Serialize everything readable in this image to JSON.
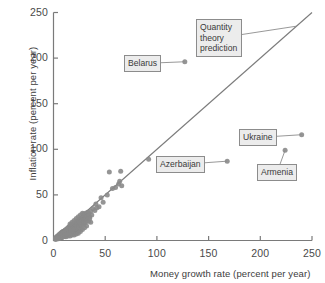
{
  "chart_data": {
    "type": "scatter",
    "title": "",
    "xlabel": "Money growth rate (percent per year)",
    "ylabel": "Inflation rate (percent per year)",
    "xlim": [
      0,
      250
    ],
    "ylim": [
      0,
      250
    ],
    "xticks": [
      0,
      50,
      100,
      150,
      200,
      250
    ],
    "yticks": [
      0,
      50,
      100,
      150,
      200,
      250
    ],
    "xtick_labels": [
      "0",
      "50",
      "100",
      "150",
      "200",
      "250"
    ],
    "ytick_labels": [
      "0",
      "50",
      "100",
      "150",
      "200",
      "250"
    ],
    "grid": false,
    "legend": "none",
    "point_color": "#8a8a8a",
    "line_color": "#7b7b7b",
    "frame_color": "#7a7a7a",
    "reference_line": {
      "name": "Quantity theory prediction",
      "slope": 1,
      "intercept": 0,
      "x": [
        0,
        250
      ],
      "y": [
        0,
        250
      ]
    },
    "series": [
      {
        "name": "Countries",
        "points": [
          [
            127,
            196
          ],
          [
            240,
            116
          ],
          [
            224,
            99
          ],
          [
            168,
            87
          ],
          [
            92,
            89
          ],
          [
            65,
            76
          ],
          [
            54,
            75
          ],
          [
            64,
            65
          ],
          [
            63,
            62
          ],
          [
            66,
            60
          ],
          [
            46,
            47
          ],
          [
            41,
            40
          ],
          [
            44,
            37
          ],
          [
            38,
            35
          ],
          [
            36,
            32
          ],
          [
            33,
            31
          ],
          [
            31,
            30
          ],
          [
            29,
            29
          ],
          [
            32,
            27
          ],
          [
            30,
            26
          ],
          [
            28,
            25
          ],
          [
            27,
            24
          ],
          [
            26,
            23
          ],
          [
            25,
            23
          ],
          [
            24,
            22
          ],
          [
            23,
            21
          ],
          [
            34,
            21
          ],
          [
            36,
            20
          ],
          [
            22,
            20
          ],
          [
            21,
            19
          ],
          [
            20,
            19
          ],
          [
            19,
            18
          ],
          [
            18,
            18
          ],
          [
            17,
            17
          ],
          [
            17,
            16
          ],
          [
            16,
            16
          ],
          [
            16,
            15
          ],
          [
            15,
            15
          ],
          [
            15,
            14
          ],
          [
            14,
            14
          ],
          [
            14,
            13
          ],
          [
            13,
            13
          ],
          [
            13,
            12
          ],
          [
            12,
            12
          ],
          [
            12,
            11
          ],
          [
            11,
            11
          ],
          [
            11,
            11
          ],
          [
            10,
            10
          ],
          [
            10,
            10
          ],
          [
            9,
            10
          ],
          [
            9,
            9
          ],
          [
            9,
            9
          ],
          [
            8,
            9
          ],
          [
            8,
            8
          ],
          [
            8,
            8
          ],
          [
            7,
            8
          ],
          [
            7,
            7
          ],
          [
            7,
            7
          ],
          [
            6,
            7
          ],
          [
            6,
            6
          ],
          [
            6,
            6
          ],
          [
            5,
            6
          ],
          [
            5,
            5
          ],
          [
            5,
            5
          ],
          [
            4,
            5
          ],
          [
            4,
            4
          ],
          [
            4,
            4
          ],
          [
            3,
            4
          ],
          [
            3,
            3
          ],
          [
            3,
            3
          ],
          [
            2,
            3
          ],
          [
            2,
            2
          ],
          [
            20,
            12
          ],
          [
            22,
            14
          ],
          [
            24,
            16
          ],
          [
            18,
            10
          ],
          [
            16,
            9
          ],
          [
            14,
            8
          ],
          [
            12,
            7
          ],
          [
            21,
            11
          ],
          [
            19,
            13
          ],
          [
            17,
            12
          ],
          [
            15,
            11
          ],
          [
            13,
            10
          ],
          [
            11,
            8
          ],
          [
            9,
            6
          ],
          [
            26,
            17
          ],
          [
            28,
            19
          ],
          [
            23,
            15
          ],
          [
            25,
            18
          ],
          [
            27,
            20
          ],
          [
            19,
            9
          ],
          [
            17,
            8
          ],
          [
            15,
            7
          ],
          [
            13,
            6
          ],
          [
            11,
            5
          ],
          [
            21,
            16
          ],
          [
            23,
            18
          ],
          [
            20,
            15
          ],
          [
            18,
            14
          ],
          [
            16,
            13
          ],
          [
            14,
            12
          ],
          [
            12,
            10
          ],
          [
            10,
            8
          ],
          [
            8,
            6
          ],
          [
            6,
            4
          ],
          [
            22,
            9
          ],
          [
            24,
            11
          ],
          [
            26,
            13
          ],
          [
            30,
            19
          ],
          [
            32,
            22
          ],
          [
            29,
            20
          ],
          [
            31,
            24
          ],
          [
            35,
            26
          ],
          [
            37,
            28
          ],
          [
            34,
            30
          ],
          [
            40,
            33
          ],
          [
            42,
            36
          ],
          [
            48,
            42
          ],
          [
            52,
            50
          ],
          [
            57,
            57
          ],
          [
            60,
            58
          ],
          [
            7,
            5
          ],
          [
            5,
            4
          ],
          [
            4,
            3
          ],
          [
            6,
            5
          ],
          [
            8,
            7
          ],
          [
            10,
            7
          ],
          [
            12,
            9
          ],
          [
            9,
            8
          ],
          [
            11,
            9
          ],
          [
            13,
            11
          ],
          [
            15,
            12
          ],
          [
            17,
            14
          ],
          [
            19,
            16
          ],
          [
            21,
            18
          ],
          [
            23,
            20
          ],
          [
            25,
            21
          ],
          [
            27,
            22
          ],
          [
            29,
            24
          ],
          [
            20,
            22
          ],
          [
            22,
            24
          ],
          [
            18,
            20
          ],
          [
            16,
            18
          ],
          [
            24,
            26
          ],
          [
            26,
            28
          ],
          [
            28,
            30
          ],
          [
            30,
            28
          ],
          [
            33,
            27
          ],
          [
            35,
            24
          ],
          [
            32,
            16
          ],
          [
            30,
            14
          ],
          [
            28,
            12
          ],
          [
            26,
            10
          ],
          [
            24,
            8
          ],
          [
            22,
            7
          ],
          [
            20,
            6
          ],
          [
            18,
            6
          ],
          [
            16,
            5
          ],
          [
            14,
            5
          ],
          [
            12,
            4
          ],
          [
            10,
            4
          ],
          [
            8,
            3
          ],
          [
            6,
            3
          ],
          [
            4,
            2
          ],
          [
            3,
            2
          ],
          [
            2,
            1
          ],
          [
            5,
            2
          ],
          [
            7,
            3
          ],
          [
            9,
            4
          ],
          [
            11,
            6
          ],
          [
            13,
            7
          ],
          [
            15,
            8
          ],
          [
            17,
            10
          ],
          [
            19,
            11
          ],
          [
            21,
            13
          ],
          [
            23,
            14
          ],
          [
            25,
            15
          ],
          [
            27,
            17
          ],
          [
            29,
            18
          ],
          [
            31,
            20
          ]
        ]
      }
    ],
    "annotations": [
      {
        "id": "belarus",
        "label": "Belarus",
        "target_point": [
          127,
          196
        ],
        "box_x_px": 124,
        "box_y_px": 55,
        "multiline": false
      },
      {
        "id": "quantity-theory-prediction",
        "label": "Quantity theory prediction",
        "target_point": [
          235,
          235
        ],
        "box_x_px": 196,
        "box_y_px": 19,
        "multiline": true
      },
      {
        "id": "ukraine",
        "label": "Ukraine",
        "target_point": [
          240,
          116
        ],
        "box_x_px": 239,
        "box_y_px": 129,
        "multiline": false
      },
      {
        "id": "armenia",
        "label": "Armenia",
        "target_point": [
          224,
          99
        ],
        "box_x_px": 257,
        "box_y_px": 164,
        "multiline": false
      },
      {
        "id": "azerbaijan",
        "label": "Azerbaijan",
        "target_point": [
          168,
          87
        ],
        "box_x_px": 156,
        "box_y_px": 156,
        "multiline": false
      }
    ]
  }
}
